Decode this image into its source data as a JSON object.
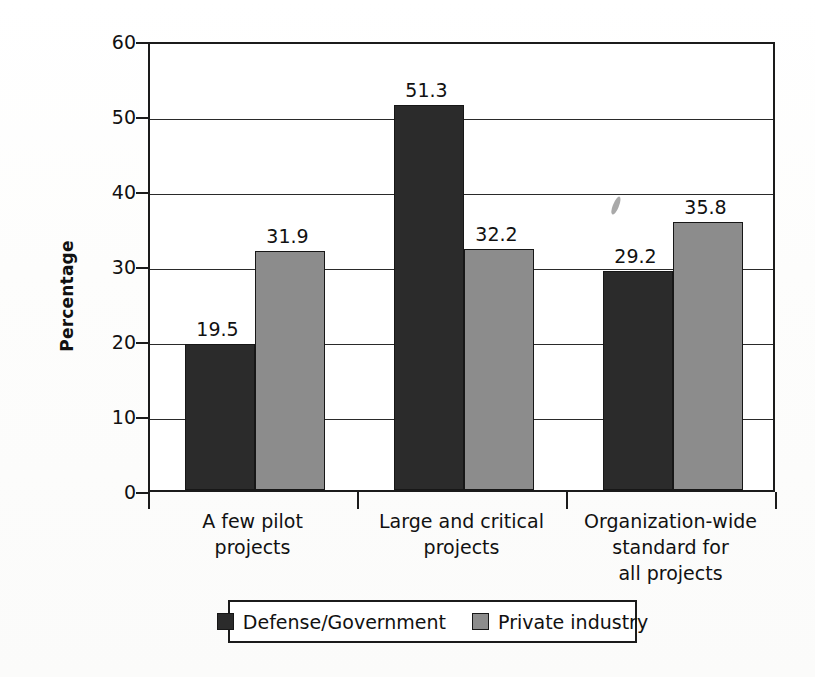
{
  "chart_data": {
    "type": "bar",
    "title": "",
    "xlabel": "",
    "ylabel": "Percentage",
    "ylim": [
      0,
      60
    ],
    "yticks": [
      0,
      10,
      20,
      30,
      40,
      50,
      60
    ],
    "ytick_labels": [
      "0",
      "10",
      "20",
      "30",
      "40",
      "50",
      "60"
    ],
    "grid": true,
    "legend_position": "bottom",
    "categories": [
      "A few pilot\nprojects",
      "Large and critical\nprojects",
      "Organization-wide\nstandard for\nall projects"
    ],
    "series": [
      {
        "name": "Defense/Government",
        "color": "#2b2b2b",
        "values": [
          19.5,
          51.3,
          29.2
        ],
        "value_labels": [
          "19.5",
          "51.3",
          "29.2"
        ]
      },
      {
        "name": "Private industry",
        "color": "#8c8c8c",
        "values": [
          31.9,
          32.2,
          35.8
        ],
        "value_labels": [
          "31.9",
          "32.2",
          "35.8"
        ]
      }
    ]
  },
  "legend": {
    "items": [
      {
        "label": "Defense/Government",
        "swatch": "dark"
      },
      {
        "label": "Private industry",
        "swatch": "light"
      }
    ]
  }
}
